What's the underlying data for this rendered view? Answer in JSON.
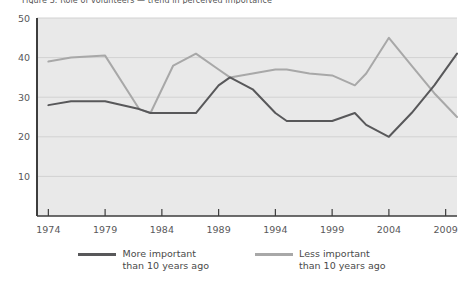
{
  "figure": {
    "title_fragment": "Figure 3. Role of volunteers — trend in perceived importance",
    "background": "#ffffff",
    "plot_background": "#e9e9e9",
    "gridline_color": "#d2d2d2",
    "axis_color": "#3d3d3d"
  },
  "legend": {
    "position": "below-plot",
    "entries": [
      {
        "label_line1": "More important",
        "label_line2": "than 10 years ago",
        "color": "#58585a"
      },
      {
        "label_line1": "Less important",
        "label_line2": "than 10 years ago",
        "color": "#a8a8a8"
      }
    ]
  },
  "chart_data": {
    "type": "line",
    "title": "",
    "xlabel": "",
    "ylabel": "",
    "xlim": [
      1973,
      2010
    ],
    "ylim": [
      0,
      50
    ],
    "yticks": [
      10,
      20,
      30,
      40,
      50
    ],
    "ytick_labels": [
      "10",
      "20",
      "30",
      "40",
      "50"
    ],
    "xticks": [
      1974,
      1979,
      1984,
      1989,
      1994,
      1999,
      2004,
      2009
    ],
    "xtick_labels": [
      "1974",
      "1979",
      "1984",
      "1989",
      "1994",
      "1999",
      "2004",
      "2009"
    ],
    "grid": true,
    "grid_axis": "y",
    "legend_position": "bottom-center",
    "x": [
      1974,
      1976,
      1979,
      1982,
      1983,
      1985,
      1987,
      1989,
      1990,
      1992,
      1994,
      1995,
      1997,
      1999,
      2001,
      2002,
      2004,
      2006,
      2008,
      2010
    ],
    "series": [
      {
        "name": "More important than 10 years ago",
        "color": "#58585a",
        "values": [
          28,
          29,
          29,
          27,
          26,
          26,
          26,
          33,
          35,
          32,
          26,
          24,
          24,
          24,
          26,
          23,
          20,
          26,
          33,
          41
        ]
      },
      {
        "name": "Less important than 10 years ago",
        "color": "#a8a8a8",
        "values": [
          39,
          40,
          40.5,
          27,
          26,
          38,
          41,
          37,
          35,
          36,
          37,
          37,
          36,
          35.5,
          33,
          36,
          45,
          38,
          31,
          25
        ]
      }
    ]
  }
}
